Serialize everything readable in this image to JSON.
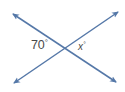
{
  "figure": {
    "background_color": "#ffffff",
    "line_color": "#5578a8",
    "label_color": "#4a4a4a",
    "intersection": {
      "x": 66,
      "y": 47
    },
    "lines": [
      {
        "name": "line-descending",
        "from": {
          "x": 13,
          "y": 14
        },
        "to": {
          "x": 116,
          "y": 82
        },
        "arrow_start": true,
        "arrow_end": true
      },
      {
        "name": "line-ascending",
        "from": {
          "x": 14,
          "y": 83
        },
        "to": {
          "x": 118,
          "y": 12
        },
        "arrow_start": true,
        "arrow_end": true
      }
    ],
    "labels": {
      "known_angle": {
        "value": "70",
        "degree_symbol": "°",
        "position": {
          "x": 31,
          "y": 39
        }
      },
      "unknown_angle": {
        "value": "x",
        "degree_symbol": "°",
        "position": {
          "x": 78,
          "y": 42
        }
      }
    }
  }
}
